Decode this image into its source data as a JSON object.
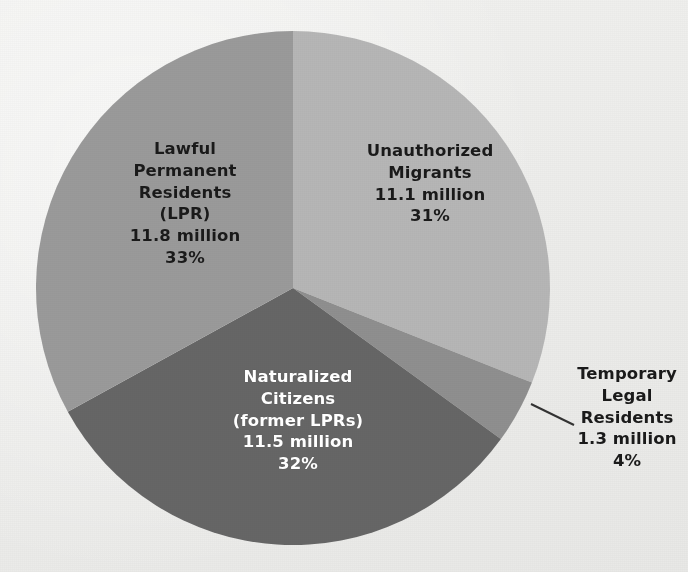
{
  "chart_data": {
    "type": "pie",
    "title": "",
    "subtitle": "",
    "xlabel": "",
    "ylabel": "",
    "legend_position": "none",
    "grid": false,
    "units": "millions of people",
    "total_label": "",
    "categories": [
      "Unauthorized Migrants",
      "Temporary Legal Residents",
      "Naturalized Citizens (former LPRs)",
      "Lawful Permanent Residents (LPR)"
    ],
    "values": [
      11.1,
      1.3,
      11.5,
      11.8
    ],
    "percents": [
      31,
      4,
      32,
      33
    ],
    "colors": [
      "#b6b6b6",
      "#8f8f8f",
      "#666666",
      "#9a9a9a"
    ],
    "start_angle_deg": 0,
    "direction": "clockwise",
    "slices": [
      {
        "name": "unauthorized-migrants",
        "label_lines": [
          "Unauthorized",
          "Migrants",
          "11.1 million",
          "31%"
        ],
        "value": 11.1,
        "value_text": "11.1 million",
        "percent": 31,
        "percent_text": "31%",
        "color": "#b6b6b6",
        "start_deg": 0,
        "end_deg": 111.6,
        "label_color": "dark",
        "label_placement": "inside"
      },
      {
        "name": "temporary-legal-residents",
        "label_lines": [
          "Temporary",
          "Legal",
          "Residents",
          "1.3 million",
          "4%"
        ],
        "value": 1.3,
        "value_text": "1.3 million",
        "percent": 4,
        "percent_text": "4%",
        "color": "#8f8f8f",
        "start_deg": 111.6,
        "end_deg": 126.0,
        "label_color": "dark",
        "label_placement": "outside-leader-line"
      },
      {
        "name": "naturalized-citizens",
        "label_lines": [
          "Naturalized",
          "Citizens",
          "(former LPRs)",
          "11.5 million",
          "32%"
        ],
        "value": 11.5,
        "value_text": "11.5 million",
        "percent": 32,
        "percent_text": "32%",
        "color": "#666666",
        "start_deg": 126.0,
        "end_deg": 241.2,
        "label_color": "white",
        "label_placement": "inside"
      },
      {
        "name": "lawful-permanent-residents",
        "label_lines": [
          "Lawful",
          "Permanent",
          "Residents",
          "(LPR)",
          "11.8 million",
          "33%"
        ],
        "value": 11.8,
        "value_text": "11.8 million",
        "percent": 33,
        "percent_text": "33%",
        "color": "#9a9a9a",
        "start_deg": 241.2,
        "end_deg": 360.0,
        "label_color": "dark",
        "label_placement": "inside"
      }
    ],
    "background_color": "#ececea",
    "leader_line_color": "#333333"
  }
}
